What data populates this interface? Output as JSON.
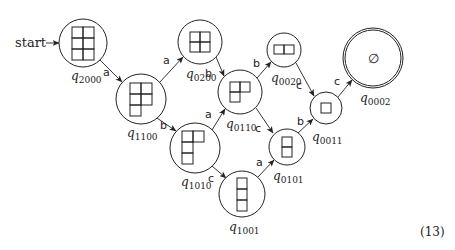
{
  "diagram": {
    "start_label": "start",
    "equation_number": "(13)",
    "empty_symbol": "∅",
    "colors": {
      "stroke": "#222222",
      "background": "#ffffff"
    },
    "nodes": [
      {
        "id": "q2000",
        "label_main": "q",
        "label_sub": "2000",
        "cx": 83,
        "cy": 43,
        "r": 24,
        "shape": "3x2 grid",
        "accepting": false,
        "start": true
      },
      {
        "id": "q1100",
        "label_main": "q",
        "label_sub": "1100",
        "cx": 141,
        "cy": 99,
        "r": 25,
        "shape": "2,2,1 rows",
        "accepting": false
      },
      {
        "id": "q0200",
        "label_main": "q",
        "label_sub": "0200",
        "cx": 200,
        "cy": 42,
        "r": 22,
        "shape": "2x2 grid",
        "accepting": false
      },
      {
        "id": "q1010",
        "label_main": "q",
        "label_sub": "1010",
        "cx": 195,
        "cy": 148,
        "r": 25,
        "shape": "2,1,1 rows",
        "accepting": false
      },
      {
        "id": "q0110",
        "label_main": "q",
        "label_sub": "0110",
        "cx": 240,
        "cy": 92,
        "r": 22,
        "shape": "2,1 rows",
        "accepting": false
      },
      {
        "id": "q0020",
        "label_main": "q",
        "label_sub": "0020",
        "cx": 284,
        "cy": 50,
        "r": 17,
        "shape": "1x2 row",
        "accepting": false
      },
      {
        "id": "q1001",
        "label_main": "q",
        "label_sub": "1001",
        "cx": 242,
        "cy": 194,
        "r": 23,
        "shape": "3x1 column",
        "accepting": false
      },
      {
        "id": "q0101",
        "label_main": "q",
        "label_sub": "0101",
        "cx": 287,
        "cy": 147,
        "r": 18,
        "shape": "2x1 column",
        "accepting": false
      },
      {
        "id": "q0011",
        "label_main": "q",
        "label_sub": "0011",
        "cx": 326,
        "cy": 108,
        "r": 16,
        "shape": "single box",
        "accepting": false
      },
      {
        "id": "q0002",
        "label_main": "q",
        "label_sub": "0002",
        "cx": 373,
        "cy": 58,
        "r": 30,
        "shape": "empty",
        "accepting": true
      }
    ],
    "edges": [
      {
        "from": "q2000",
        "to": "q1100",
        "label": "a"
      },
      {
        "from": "q1100",
        "to": "q0200",
        "label": "a"
      },
      {
        "from": "q1100",
        "to": "q1010",
        "label": "b"
      },
      {
        "from": "q0200",
        "to": "q0110",
        "label": "b"
      },
      {
        "from": "q1010",
        "to": "q0110",
        "label": "a"
      },
      {
        "from": "q1010",
        "to": "q1001",
        "label": "c"
      },
      {
        "from": "q0110",
        "to": "q0020",
        "label": "b"
      },
      {
        "from": "q0110",
        "to": "q0101",
        "label": "c"
      },
      {
        "from": "q1001",
        "to": "q0101",
        "label": "a"
      },
      {
        "from": "q0020",
        "to": "q0011",
        "label": "c"
      },
      {
        "from": "q0101",
        "to": "q0011",
        "label": "b"
      },
      {
        "from": "q0011",
        "to": "q0002",
        "label": "c"
      }
    ]
  }
}
